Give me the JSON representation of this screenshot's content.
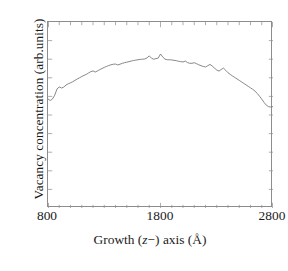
{
  "chart_data": {
    "type": "line",
    "title": "",
    "xlabel": "Growth (z−) axis (Å)",
    "xlabel_parts": {
      "before": "Growth (",
      "italic": "z",
      "after": "−) axis (Å)"
    },
    "ylabel": "Vacancy concentration (arb.units)",
    "xlim": [
      800,
      2800
    ],
    "ylim": [
      0,
      1
    ],
    "xticks": [
      800,
      1800,
      2800
    ],
    "xticklabels": [
      "800",
      "1800",
      "2800"
    ],
    "xminor_ticks": [
      900,
      1000,
      1100,
      1200,
      1300,
      1400,
      1500,
      1600,
      1700,
      1900,
      2000,
      2100,
      2200,
      2300,
      2400,
      2500,
      2600,
      2700
    ],
    "yticks": [
      0.1,
      0.2,
      0.3,
      0.4,
      0.5,
      0.6,
      0.7,
      0.8,
      0.9
    ],
    "yticklabels": [],
    "grid": false,
    "legend": null,
    "line_color": "#7a7a7a",
    "frame_color": "#8d8d8d",
    "series": [
      {
        "name": "vacancy concentration",
        "x": [
          800,
          820,
          840,
          860,
          880,
          900,
          920,
          940,
          960,
          980,
          1000,
          1020,
          1040,
          1060,
          1080,
          1100,
          1120,
          1140,
          1160,
          1180,
          1200,
          1220,
          1240,
          1260,
          1280,
          1300,
          1320,
          1340,
          1360,
          1380,
          1400,
          1420,
          1440,
          1460,
          1480,
          1500,
          1520,
          1540,
          1560,
          1580,
          1600,
          1620,
          1640,
          1660,
          1680,
          1700,
          1720,
          1740,
          1760,
          1780,
          1800,
          1820,
          1840,
          1860,
          1880,
          1900,
          1920,
          1940,
          1960,
          1980,
          2000,
          2020,
          2040,
          2060,
          2080,
          2100,
          2120,
          2140,
          2160,
          2180,
          2200,
          2220,
          2240,
          2260,
          2280,
          2300,
          2320,
          2340,
          2360,
          2380,
          2400,
          2420,
          2440,
          2460,
          2480,
          2500,
          2520,
          2540,
          2560,
          2580,
          2600,
          2620,
          2640,
          2660,
          2680,
          2700,
          2720,
          2740,
          2760,
          2780,
          2800
        ],
        "y": [
          0.586,
          0.578,
          0.586,
          0.607,
          0.64,
          0.651,
          0.645,
          0.65,
          0.661,
          0.668,
          0.673,
          0.679,
          0.686,
          0.694,
          0.7,
          0.707,
          0.713,
          0.718,
          0.726,
          0.733,
          0.737,
          0.731,
          0.737,
          0.744,
          0.75,
          0.756,
          0.761,
          0.766,
          0.77,
          0.773,
          0.774,
          0.769,
          0.773,
          0.778,
          0.781,
          0.784,
          0.787,
          0.79,
          0.793,
          0.795,
          0.797,
          0.799,
          0.8,
          0.801,
          0.807,
          0.818,
          0.805,
          0.8,
          0.803,
          0.806,
          0.828,
          0.812,
          0.8,
          0.797,
          0.797,
          0.796,
          0.794,
          0.792,
          0.789,
          0.787,
          0.785,
          0.79,
          0.782,
          0.778,
          0.778,
          0.781,
          0.776,
          0.77,
          0.765,
          0.761,
          0.758,
          0.765,
          0.772,
          0.763,
          0.752,
          0.742,
          0.736,
          0.745,
          0.752,
          0.74,
          0.727,
          0.718,
          0.71,
          0.702,
          0.694,
          0.686,
          0.678,
          0.67,
          0.662,
          0.654,
          0.646,
          0.638,
          0.628,
          0.616,
          0.601,
          0.585,
          0.568,
          0.553,
          0.545,
          0.543,
          0.545
        ]
      }
    ]
  }
}
